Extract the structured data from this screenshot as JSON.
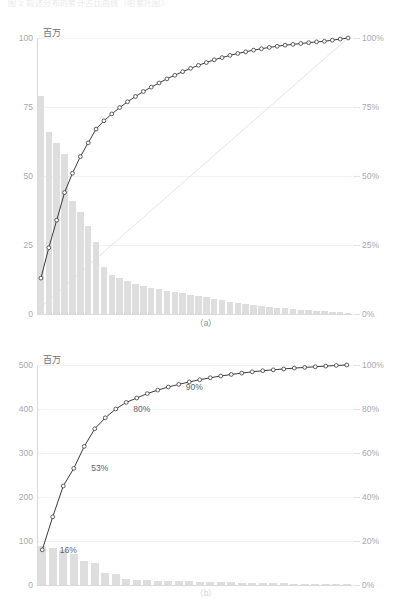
{
  "document": {
    "top_caption": "图 2 前述分布的累计占比曲线（帕累托图）",
    "unit_label": "百万"
  },
  "figures": [
    {
      "id": "figure-a",
      "caption": "（a）",
      "y_axis_label": "百万",
      "left_ticks": [
        "100",
        "75",
        "50",
        "25",
        "0"
      ],
      "right_ticks": [
        "100%",
        "75%",
        "50%",
        "25%",
        "0%"
      ]
    },
    {
      "id": "figure-b",
      "caption": "（b）",
      "y_axis_label": "百万",
      "left_ticks": [
        "500",
        "400",
        "300",
        "200",
        "100",
        "0"
      ],
      "right_ticks": [
        "100%",
        "80%",
        "60%",
        "40%",
        "20%",
        "0%"
      ],
      "annotations": [
        {
          "text": "16%",
          "index": 1
        },
        {
          "text": "53%",
          "index": 5
        },
        {
          "text": "80%",
          "index": 11
        },
        {
          "text": "90%",
          "index": 15
        }
      ]
    }
  ],
  "colors": {
    "bar": "#dededf",
    "curve": "#3a3a3f",
    "marker_fill": "#ffffff",
    "reference_line": "#dcdce0",
    "grid": "#f1f1f3",
    "tick_text": "#a8a8ad",
    "label_text": "#5e5e63"
  },
  "chart_data": [
    {
      "type": "bar",
      "title": "",
      "subtitle": "",
      "caption": "（a）",
      "xlabel": "",
      "ylabel": "百万",
      "y2label": "",
      "ylim": [
        0,
        100
      ],
      "y2lim": [
        0,
        100
      ],
      "yticks": [
        0,
        25,
        50,
        75,
        100
      ],
      "y2ticks": [
        0,
        25,
        50,
        75,
        100
      ],
      "grid": true,
      "legend": "none",
      "categories": [
        "1",
        "2",
        "3",
        "4",
        "5",
        "6",
        "7",
        "8",
        "9",
        "10",
        "11",
        "12",
        "13",
        "14",
        "15",
        "16",
        "17",
        "18",
        "19",
        "20",
        "21",
        "22",
        "23",
        "24",
        "25",
        "26",
        "27",
        "28",
        "29",
        "30",
        "31",
        "32",
        "33",
        "34",
        "35",
        "36",
        "37",
        "38",
        "39",
        "40"
      ],
      "values": [
        79,
        66,
        62,
        58,
        41,
        37,
        32,
        26,
        17,
        14,
        13,
        12,
        11,
        10,
        9.5,
        9,
        8.5,
        8,
        7.5,
        7,
        6.5,
        6,
        5.5,
        5,
        4.5,
        4,
        3.6,
        3.2,
        2.9,
        2.6,
        2.3,
        2.0,
        1.8,
        1.6,
        1.4,
        1.2,
        1.0,
        0.8,
        0.6,
        0.4
      ],
      "series": [
        {
          "name": "累计占比",
          "type": "line",
          "axis": "right",
          "values": [
            13,
            24,
            34,
            44,
            51,
            57,
            62,
            67,
            70,
            72.5,
            74.8,
            76.9,
            78.8,
            80.6,
            82.2,
            83.7,
            85.2,
            86.5,
            87.8,
            89.0,
            90.1,
            91.1,
            92.1,
            92.9,
            93.7,
            94.4,
            95.0,
            95.6,
            96.1,
            96.6,
            97.0,
            97.4,
            97.7,
            98.0,
            98.3,
            98.6,
            98.8,
            99.2,
            99.6,
            100.0
          ]
        },
        {
          "name": "参考线",
          "type": "line",
          "axis": "right",
          "values": [
            2.5,
            5,
            7.5,
            10,
            12.5,
            15,
            17.5,
            20,
            22.5,
            25,
            27.5,
            30,
            32.5,
            35,
            37.5,
            40,
            42.5,
            45,
            47.5,
            50,
            52.5,
            55,
            57.5,
            60,
            62.5,
            65,
            67.5,
            70,
            72.5,
            75,
            77.5,
            80,
            82.5,
            85,
            87.5,
            90,
            92.5,
            95,
            97.5,
            100
          ]
        }
      ]
    },
    {
      "type": "bar",
      "title": "",
      "subtitle": "",
      "caption": "（b）",
      "xlabel": "",
      "ylabel": "百万",
      "y2label": "",
      "ylim": [
        0,
        500
      ],
      "y2lim": [
        0,
        100
      ],
      "yticks": [
        0,
        100,
        200,
        300,
        400,
        500
      ],
      "y2ticks": [
        0,
        20,
        40,
        60,
        80,
        100
      ],
      "grid": true,
      "legend": "none",
      "categories": [
        "1",
        "2",
        "3",
        "4",
        "5",
        "6",
        "7",
        "8",
        "9",
        "10",
        "11",
        "12",
        "13",
        "14",
        "15",
        "16",
        "17",
        "18",
        "19",
        "20",
        "21",
        "22",
        "23",
        "24",
        "25",
        "26",
        "27",
        "28",
        "29",
        "30"
      ],
      "values": [
        88,
        84,
        80,
        70,
        55,
        50,
        28,
        24,
        13,
        12,
        11,
        10,
        9,
        8.5,
        8,
        7.5,
        7,
        6.5,
        6,
        5.5,
        5,
        4.5,
        4,
        3.5,
        3,
        2.5,
        2,
        1.6,
        1.2,
        0.8
      ],
      "series": [
        {
          "name": "累计占比",
          "type": "line",
          "axis": "right",
          "values": [
            16,
            31,
            45,
            53,
            63,
            71,
            76,
            80,
            83,
            85,
            87,
            88.6,
            90,
            91.2,
            92.3,
            93.3,
            94.2,
            95.0,
            95.7,
            96.3,
            96.9,
            97.4,
            97.8,
            98.2,
            98.6,
            98.9,
            99.2,
            99.5,
            99.8,
            100.0
          ]
        }
      ],
      "annotations": [
        {
          "text": "16%",
          "x_index": 1,
          "y": 16
        },
        {
          "text": "53%",
          "x_index": 4,
          "y": 53
        },
        {
          "text": "80%",
          "x_index": 8,
          "y": 80
        },
        {
          "text": "90%",
          "x_index": 13,
          "y": 90
        }
      ]
    }
  ]
}
